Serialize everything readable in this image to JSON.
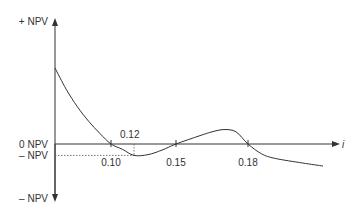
{
  "chart_data": {
    "type": "line",
    "title": "",
    "xlabel": "i",
    "ylabel": "",
    "y_labels": {
      "top": "+ NPV",
      "zero": "0 NPV",
      "min_ref": "– NPV",
      "bottom": "– NPV"
    },
    "x_ticks": [
      {
        "value": 0.1,
        "label": "0.10",
        "position": "below"
      },
      {
        "value": 0.12,
        "label": "0.12",
        "position": "above"
      },
      {
        "value": 0.15,
        "label": "0.15",
        "position": "below"
      },
      {
        "value": 0.18,
        "label": "0.18",
        "position": "below"
      }
    ],
    "series": [
      {
        "name": "NPV profile",
        "points": [
          [
            0.0,
            1.0
          ],
          [
            0.02,
            0.72
          ],
          [
            0.04,
            0.49
          ],
          [
            0.06,
            0.3
          ],
          [
            0.08,
            0.14
          ],
          [
            0.1,
            0.0
          ],
          [
            0.11,
            -0.07
          ],
          [
            0.12,
            -0.15
          ],
          [
            0.13,
            -0.14
          ],
          [
            0.14,
            -0.08
          ],
          [
            0.15,
            0.0
          ],
          [
            0.16,
            0.11
          ],
          [
            0.165,
            0.16
          ],
          [
            0.17,
            0.19
          ],
          [
            0.175,
            0.16
          ],
          [
            0.18,
            0.0
          ],
          [
            0.19,
            -0.13
          ],
          [
            0.2,
            -0.19
          ],
          [
            0.22,
            -0.25
          ],
          [
            0.235,
            -0.29
          ]
        ]
      }
    ],
    "annotations": [
      "Dotted guide from min NPV at i = 0.12 to the vertical axis"
    ],
    "grid": false,
    "legend": "none"
  }
}
